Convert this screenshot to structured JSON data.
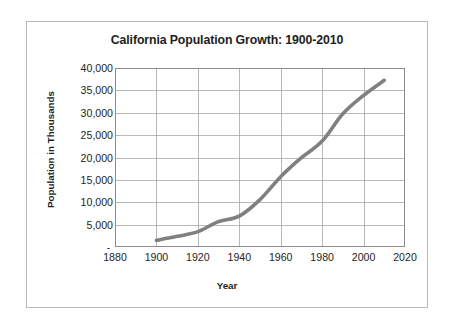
{
  "figure": {
    "border_color": "#b9b9b9",
    "background": "#ffffff"
  },
  "chart_data": {
    "type": "line",
    "title": "California Population Growth: 1900-2010",
    "xlabel": "Year",
    "ylabel": "Population in Thousands",
    "xlim": [
      1880,
      2020
    ],
    "ylim": [
      0,
      40000
    ],
    "grid": true,
    "legend": false,
    "legend_position": "none",
    "series_color": "#808080",
    "x_tick_labels": [
      "1880",
      "1900",
      "1920",
      "1940",
      "1960",
      "1980",
      "2000",
      "2020"
    ],
    "x_ticks": [
      1880,
      1900,
      1920,
      1940,
      1960,
      1980,
      2000,
      2020
    ],
    "y_tick_labels": [
      "40,000",
      "35,000",
      "30,000",
      "25,000",
      "20,000",
      "15,000",
      "10,000",
      "5,000",
      "-"
    ],
    "y_ticks": [
      40000,
      35000,
      30000,
      25000,
      20000,
      15000,
      10000,
      5000,
      0
    ],
    "x": [
      1900,
      1910,
      1920,
      1930,
      1940,
      1950,
      1960,
      1970,
      1980,
      1990,
      2000,
      2010
    ],
    "values": [
      1485,
      2378,
      3427,
      5677,
      6907,
      10586,
      15717,
      19953,
      23668,
      29760,
      33872,
      37254
    ],
    "series": [
      {
        "name": "California Population",
        "color": "#808080",
        "points": [
          {
            "year": 1900,
            "population": 1485
          },
          {
            "year": 1910,
            "population": 2378
          },
          {
            "year": 1920,
            "population": 3427
          },
          {
            "year": 1930,
            "population": 5677
          },
          {
            "year": 1940,
            "population": 6907
          },
          {
            "year": 1950,
            "population": 10586
          },
          {
            "year": 1960,
            "population": 15717
          },
          {
            "year": 1970,
            "population": 19953
          },
          {
            "year": 1980,
            "population": 23668
          },
          {
            "year": 1990,
            "population": 29760
          },
          {
            "year": 2000,
            "population": 33872
          },
          {
            "year": 2010,
            "population": 37254
          }
        ]
      }
    ]
  }
}
